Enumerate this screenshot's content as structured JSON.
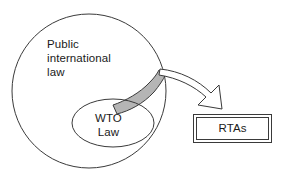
{
  "diagram": {
    "type": "venn-euler-diagram",
    "colors": {
      "stroke": "#3a3a3a",
      "shaded_region_fill": "#b5b5b5",
      "background": "#ffffff",
      "text": "#1a1a1a"
    },
    "shapes": {
      "outer_circle": {
        "name": "public-international-law-circle",
        "cx": 89,
        "cy": 91,
        "r": 77
      },
      "inner_ellipse": {
        "name": "wto-law-ellipse",
        "cx": 113,
        "cy": 123,
        "rx": 41,
        "ry": 24
      },
      "shaded_band": {
        "name": "overlap-band",
        "description": "grey crescent between WTO law ellipse and outer circle edge"
      },
      "rtas_box": {
        "name": "rtas-box",
        "x": 193,
        "y": 114,
        "width": 79,
        "height": 29,
        "double_border": true
      },
      "arrow": {
        "name": "curved-block-arrow",
        "from": "outer circle edge at overlap band",
        "to": "rtas box"
      }
    },
    "labels": {
      "public_international_law": "Public\ninternational\nlaw",
      "wto_law": "WTO\nLaw",
      "rtas": "RTAs"
    }
  }
}
